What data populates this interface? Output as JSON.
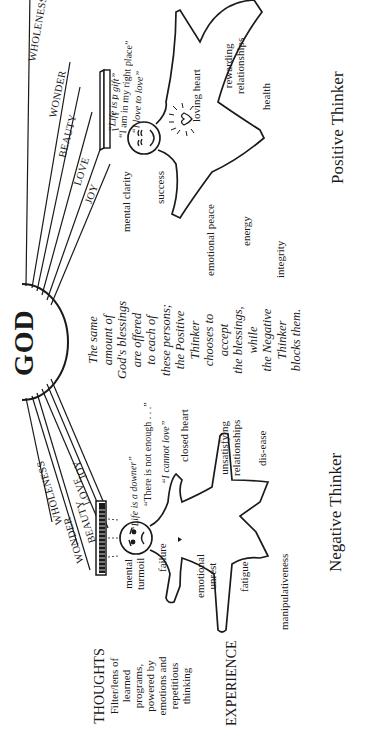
{
  "source": {
    "center_label": "GOD",
    "center_statement": [
      "The same",
      "amount of",
      "God's blessings",
      "are offered",
      "to each of",
      "these persons;",
      "the Positive",
      "Thinker",
      "chooses to",
      "accept",
      "the blessings,",
      "while",
      "the Negative",
      "Thinker",
      "blocks them."
    ]
  },
  "blessings": {
    "negative_side": [
      "WHOLENESS",
      "WONDER",
      "BEAUTY",
      "LOVE",
      "JOY"
    ],
    "positive_side": [
      "WHOLENESS",
      "WONDER",
      "BEAUTY",
      "LOVE",
      "JOY"
    ]
  },
  "legend": {
    "thoughts": {
      "title": "THOUGHTS",
      "lines": [
        "Filter/lens of",
        "learned",
        "programs,",
        "powered by",
        "emotions and",
        "repetitious",
        "thinking"
      ]
    },
    "experience": {
      "title": "EXPERIENCE"
    }
  },
  "negative_thinker": {
    "title": "Negative Thinker",
    "quotes": [
      "“Life is a downer”",
      "“There is not enough . . .”",
      "“I cannot love”"
    ],
    "experiences": {
      "mental_turmoil": [
        "mental",
        "turmoil"
      ],
      "failure": "failure",
      "emotional_unrest": [
        "emotional",
        "unrest"
      ],
      "fatigue": "fatigue",
      "manipulativeness": "manipulativeness",
      "closed_heart": "closed heart",
      "unsatisfying_relationships": [
        "unsatisfying",
        "relationships"
      ],
      "dis_ease": "dis-ease"
    }
  },
  "positive_thinker": {
    "title": "Positive Thinker",
    "quotes": [
      "“Life is a gift”",
      "“I am in my right place”",
      "“I love to love”"
    ],
    "experiences": {
      "mental_clarity": "mental clarity",
      "success": "success",
      "emotional_peace": "emotional peace",
      "energy": "energy",
      "integrity": "integrity",
      "loving_heart": "loving heart",
      "rewarding_relationships": [
        "rewarding",
        "relationships"
      ],
      "health": "health"
    }
  },
  "colors": {
    "ink": "#1a1a1a",
    "paper": "#ffffff"
  }
}
